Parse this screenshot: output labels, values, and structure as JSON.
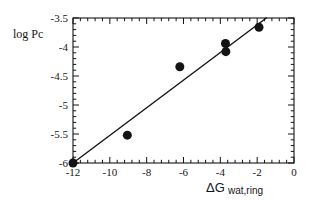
{
  "chart_data": {
    "type": "scatter",
    "title": "",
    "xlabel": "ΔGwat,ring",
    "xlabel_parts": {
      "lead": "ΔG",
      "sub": "wat,ring"
    },
    "ylabel": "log Pc",
    "xlim": [
      -12,
      0
    ],
    "ylim": [
      -6,
      -3.5
    ],
    "xticks": [
      -12,
      -10,
      -8,
      -6,
      -4,
      -2,
      0
    ],
    "xticklabels": [
      "-12",
      "-10",
      "-8",
      "-6",
      "-4",
      "-2",
      "0"
    ],
    "yticks": [
      -6,
      -5.5,
      -5,
      -4.5,
      -4,
      -3.5
    ],
    "yticklabels": [
      "-6",
      "-5.5",
      "-5",
      "-4.5",
      "-4",
      "-3.5"
    ],
    "minor_ticks_per_interval": 4,
    "grid": false,
    "legend": "none",
    "marker": "filled-circle",
    "marker_color": "#141414",
    "marker_size_px": 9,
    "line_color": "#141414",
    "frame_color": "#141414",
    "points": [
      {
        "x": -12.0,
        "y": -6.0
      },
      {
        "x": -9.05,
        "y": -5.52
      },
      {
        "x": -6.2,
        "y": -4.34
      },
      {
        "x": -3.72,
        "y": -3.94
      },
      {
        "x": -3.7,
        "y": -4.08
      },
      {
        "x": -1.9,
        "y": -3.66
      }
    ],
    "fit_line": {
      "name": "linear-fit",
      "x_start": -12.0,
      "y_start": -6.0,
      "x_end": -1.5,
      "y_end": -3.5
    }
  },
  "axes": {
    "y_axis_label_text": "log Pc",
    "x_axis_label_text": "ΔGwat,ring"
  }
}
